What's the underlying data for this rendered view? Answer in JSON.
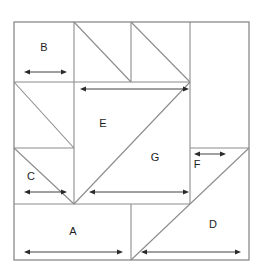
{
  "figure": {
    "kind": "square-dissection",
    "line_color": "#8c8c8c",
    "dimension_color": "#2b2b2b",
    "background_color": "#ffffff",
    "outer_square": {
      "x": 14,
      "y": 22,
      "width": 235,
      "height": 238
    }
  },
  "pieces": [
    {
      "id": "A",
      "label": "A",
      "shape": "rectangle",
      "label_x": 73,
      "label_y": 232
    },
    {
      "id": "B",
      "label": "B",
      "shape": "rectangle",
      "label_x": 44,
      "label_y": 48
    },
    {
      "id": "C",
      "label": "C",
      "shape": "triangle",
      "label_x": 31,
      "label_y": 177
    },
    {
      "id": "D",
      "label": "D",
      "shape": "triangle",
      "label_x": 213,
      "label_y": 225
    },
    {
      "id": "E",
      "label": "E",
      "shape": "triangle",
      "label_x": 103,
      "label_y": 124
    },
    {
      "id": "F",
      "label": "F",
      "shape": "triangle",
      "label_x": 197,
      "label_y": 165
    },
    {
      "id": "G",
      "label": "G",
      "shape": "triangle",
      "label_x": 155,
      "label_y": 158
    }
  ],
  "dimension_arrows": [
    {
      "id": "arrow-b",
      "for_piece": "B",
      "x1": 24,
      "x2": 67,
      "y": 72,
      "heads": "both"
    },
    {
      "id": "arrow-e",
      "for_piece": "E",
      "x1": 80,
      "x2": 189,
      "y": 89,
      "heads": "both"
    },
    {
      "id": "arrow-f",
      "for_piece": "F",
      "x1": 194,
      "x2": 226,
      "y": 154,
      "heads": "both"
    },
    {
      "id": "arrow-c",
      "for_piece": "C",
      "x1": 24,
      "x2": 67,
      "y": 192,
      "heads": "both"
    },
    {
      "id": "arrow-g",
      "for_piece": "G",
      "x1": 89,
      "x2": 189,
      "y": 192,
      "heads": "both"
    },
    {
      "id": "arrow-a",
      "for_piece": "A",
      "x1": 24,
      "x2": 123,
      "y": 252,
      "heads": "both"
    },
    {
      "id": "arrow-d",
      "for_piece": "D",
      "x1": 141,
      "x2": 241,
      "y": 252,
      "heads": "both"
    }
  ],
  "grid_lines": {
    "verticals": [
      74,
      131,
      190
    ],
    "horizontals": [
      82,
      148,
      204
    ]
  }
}
